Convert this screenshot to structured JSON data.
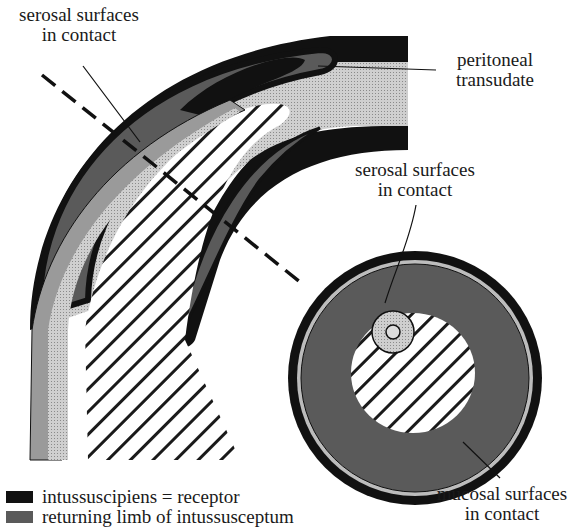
{
  "labels": {
    "serosal_top": [
      "serosal surfaces",
      "in contact"
    ],
    "peritoneal": [
      "peritoneal",
      "transudate"
    ],
    "serosal_cross": [
      "serosal surfaces",
      "in contact"
    ],
    "mucosal": [
      "mucosal surfaces",
      "in contact"
    ]
  },
  "legend": [
    {
      "swatch": "dark",
      "color": "#111111",
      "label": "intussuscipiens = receptor"
    },
    {
      "swatch": "medium",
      "color": "#5a5a5a",
      "label": "returning limb of intussusceptum"
    }
  ],
  "colors": {
    "receptor": "#111111",
    "returning_limb": "#585858",
    "light_layer": "#9a9a9a",
    "transudate": "#c8c8c8",
    "hatch": "#1a1a1a"
  }
}
